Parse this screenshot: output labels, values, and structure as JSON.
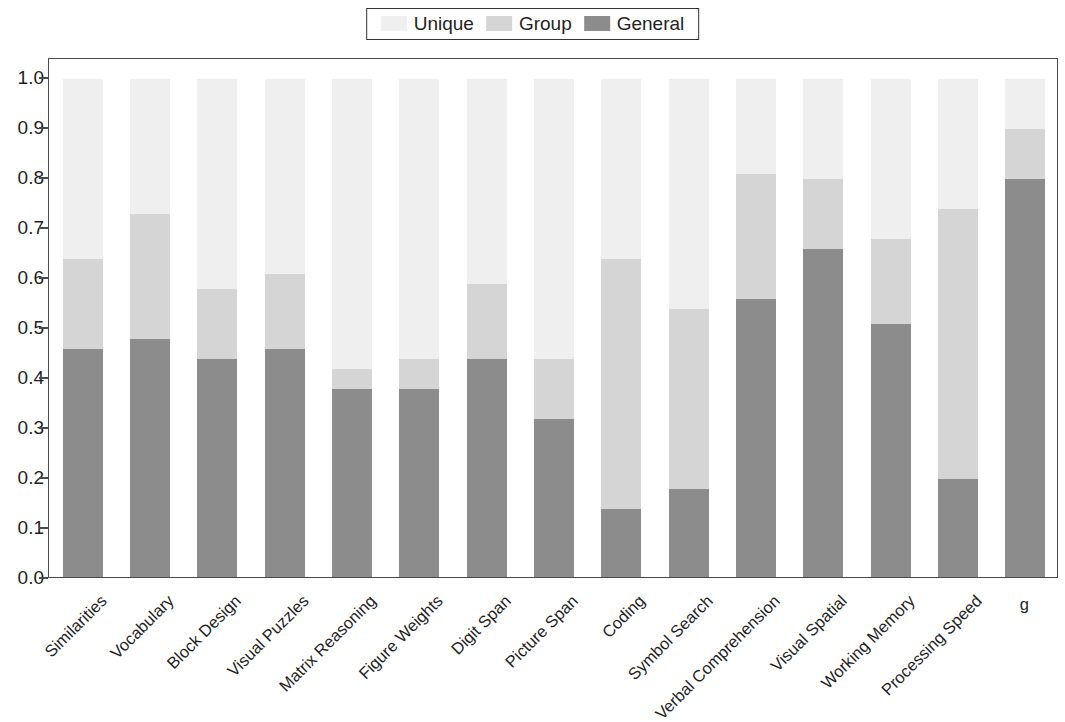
{
  "legend": {
    "items": [
      {
        "label": "Unique",
        "color": "#efefef"
      },
      {
        "label": "Group",
        "color": "#d5d5d5"
      },
      {
        "label": "General",
        "color": "#8c8c8c"
      }
    ]
  },
  "axis": {
    "y_ticks": [
      "1.0",
      "0.9",
      "0.8",
      "0.7",
      "0.6",
      "0.5",
      "0.4",
      "0.3",
      "0.2",
      "0.1",
      "0.0"
    ]
  },
  "chart_data": {
    "type": "bar",
    "stacked": true,
    "title": "",
    "subtitle": "",
    "xlabel": "",
    "ylabel": "",
    "ylim": [
      0.0,
      1.0
    ],
    "ytick_values": [
      0.0,
      0.1,
      0.2,
      0.3,
      0.4,
      0.5,
      0.6,
      0.7,
      0.8,
      0.9,
      1.0
    ],
    "grid": false,
    "legend_position": "top-center",
    "categories": [
      "Similarities",
      "Vocabulary",
      "Block Design",
      "Visual Puzzles",
      "Matrix Reasoning",
      "Figure Weights",
      "Digit Span",
      "Picture Span",
      "Coding",
      "Symbol Search",
      "Verbal Comprehension",
      "Visual Spatial",
      "Working Memory",
      "Processing Speed",
      "g"
    ],
    "series": [
      {
        "name": "General",
        "color": "#8c8c8c",
        "values": [
          0.46,
          0.48,
          0.44,
          0.46,
          0.38,
          0.38,
          0.44,
          0.32,
          0.14,
          0.18,
          0.56,
          0.66,
          0.51,
          0.2,
          0.8
        ]
      },
      {
        "name": "Group",
        "color": "#d5d5d5",
        "values": [
          0.18,
          0.25,
          0.14,
          0.15,
          0.04,
          0.06,
          0.15,
          0.12,
          0.5,
          0.36,
          0.25,
          0.14,
          0.17,
          0.54,
          0.1
        ]
      },
      {
        "name": "Unique",
        "color": "#efefef",
        "values": [
          0.36,
          0.27,
          0.42,
          0.39,
          0.58,
          0.56,
          0.41,
          0.56,
          0.36,
          0.46,
          0.19,
          0.2,
          0.32,
          0.26,
          0.1
        ]
      }
    ],
    "cumulative_tops": {
      "general": [
        0.46,
        0.48,
        0.44,
        0.46,
        0.38,
        0.38,
        0.44,
        0.32,
        0.14,
        0.18,
        0.56,
        0.66,
        0.51,
        0.2,
        0.8
      ],
      "group": [
        0.64,
        0.73,
        0.58,
        0.61,
        0.42,
        0.44,
        0.59,
        0.44,
        0.64,
        0.54,
        0.81,
        0.8,
        0.68,
        0.74,
        0.9
      ],
      "unique": [
        1.0,
        1.0,
        1.0,
        1.0,
        1.0,
        1.0,
        1.0,
        1.0,
        1.0,
        1.0,
        1.0,
        1.0,
        1.0,
        1.0,
        1.0
      ]
    }
  }
}
